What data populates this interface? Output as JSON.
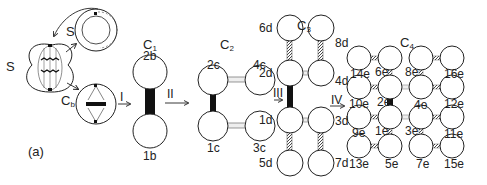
{
  "figure": {
    "panel_label": "(a)",
    "left": {
      "mitotic_cell_label": "S",
      "interphase_cell_label": "S",
      "cb_cell_label": "C",
      "cb_cell_sub": "b"
    },
    "divisions": [
      "I",
      "II",
      "III",
      "IV"
    ],
    "stages": [
      {
        "name": "C",
        "sub": "1",
        "cells": [
          "2b",
          "1b"
        ]
      },
      {
        "name": "C",
        "sub": "2",
        "cells": [
          "2c",
          "4c",
          "1c",
          "3c"
        ]
      },
      {
        "name": "C",
        "sub": "3",
        "cells": [
          "6d",
          "8d",
          "2d",
          "4d",
          "1d",
          "3d",
          "5d",
          "7d"
        ]
      },
      {
        "name": "C",
        "sub": "4",
        "cells": [
          "14e",
          "6e",
          "8e",
          "16e",
          "10e",
          "2e",
          "4e",
          "12e",
          "9e",
          "1e",
          "3e",
          "11e",
          "13e",
          "5e",
          "7e",
          "15e"
        ]
      }
    ]
  }
}
